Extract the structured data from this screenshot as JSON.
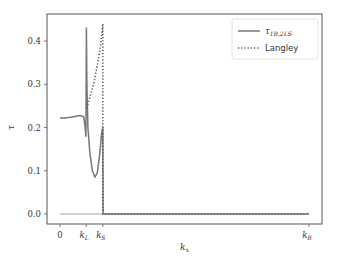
{
  "chart_data": {
    "type": "line",
    "title": "",
    "xlabel": "k_x",
    "ylabel": "τ",
    "ylim": [
      -0.02,
      0.46
    ],
    "yticks": [
      0.0,
      0.1,
      0.2,
      0.3,
      0.4
    ],
    "ytick_labels": [
      "0.0",
      "0.1",
      "0.2",
      "0.3",
      "0.4"
    ],
    "xticks": [
      {
        "label": "0",
        "sub": "",
        "pos": 0
      },
      {
        "label": "k",
        "sub": "L",
        "pos": 0.105
      },
      {
        "label": "k",
        "sub": "S",
        "pos": 0.172
      },
      {
        "label": "k",
        "sub": "B",
        "pos": 1.0
      }
    ],
    "grid": false,
    "legend_position": "upper right",
    "series": [
      {
        "name": "τ_{1B,2LS}",
        "style": "solid",
        "color": "#777777",
        "x": [
          0,
          0.02,
          0.05,
          0.08,
          0.095,
          0.1,
          0.104,
          0.106,
          0.108,
          0.112,
          0.12,
          0.13,
          0.14,
          0.15,
          0.16,
          0.168,
          0.172,
          0.173,
          1.0
        ],
        "y": [
          0.222,
          0.222,
          0.224,
          0.228,
          0.225,
          0.205,
          0.18,
          0.43,
          0.3,
          0.2,
          0.14,
          0.1,
          0.085,
          0.095,
          0.14,
          0.19,
          0.2,
          0.0,
          0.0
        ]
      },
      {
        "name": "Langley",
        "style": "dotted",
        "color": "#555555",
        "x": [
          0.108,
          0.115,
          0.125,
          0.135,
          0.145,
          0.155,
          0.165,
          0.172,
          0.172,
          0.18,
          1.0
        ],
        "y": [
          0.245,
          0.26,
          0.28,
          0.3,
          0.33,
          0.36,
          0.4,
          0.44,
          0.0,
          0.0,
          0.0
        ]
      },
      {
        "name": "baseline",
        "style": "solid-thin",
        "color": "#999999",
        "x": [
          0,
          0.172
        ],
        "y": [
          0.0,
          0.0
        ]
      }
    ]
  },
  "legend": {
    "items": [
      {
        "label": "τ",
        "sub": "1B,2LS",
        "style": "solid"
      },
      {
        "label": "Langley",
        "sub": "",
        "style": "dotted"
      }
    ]
  },
  "axes": {
    "ylabel": "τ",
    "xlabel_main": "k",
    "xlabel_sub": "x"
  }
}
